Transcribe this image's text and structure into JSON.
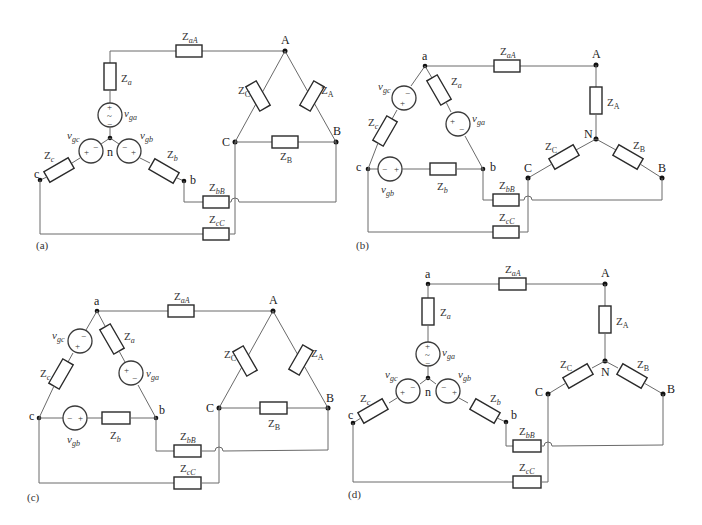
{
  "figure": {
    "panels": [
      {
        "id": "a",
        "caption": "(a)",
        "source_topology": "wye",
        "load_topology": "delta",
        "nodes": {
          "source_a": "a",
          "source_b": "b",
          "source_c": "c",
          "source_neutral": "n",
          "load_A": "A",
          "load_B": "B",
          "load_C": "C"
        },
        "labels": {
          "Z_line_a": "Z",
          "Z_line_a_sub": "aA",
          "Z_line_b": "Z",
          "Z_line_b_sub": "bB",
          "Z_line_c": "Z",
          "Z_line_c_sub": "cC",
          "Z_src_a": "Z",
          "Z_src_a_sub": "a",
          "Z_src_b": "Z",
          "Z_src_b_sub": "b",
          "Z_src_c": "Z",
          "Z_src_c_sub": "c",
          "v_a": "v",
          "v_a_sub": "ga",
          "v_b": "v",
          "v_b_sub": "gb",
          "v_c": "v",
          "v_c_sub": "gc",
          "Z_load_A": "Z",
          "Z_load_A_sub": "A",
          "Z_load_B": "Z",
          "Z_load_B_sub": "B",
          "Z_load_C": "Z",
          "Z_load_C_sub": "C"
        }
      },
      {
        "id": "b",
        "caption": "(b)",
        "source_topology": "delta",
        "load_topology": "wye",
        "nodes": {
          "source_a": "a",
          "source_b": "b",
          "source_c": "c",
          "load_A": "A",
          "load_B": "B",
          "load_C": "C",
          "load_neutral": "N"
        },
        "labels": {
          "Z_line_a": "Z",
          "Z_line_a_sub": "aA",
          "Z_line_b": "Z",
          "Z_line_b_sub": "bB",
          "Z_line_c": "Z",
          "Z_line_c_sub": "cC",
          "Z_src_a": "Z",
          "Z_src_a_sub": "a",
          "Z_src_b": "Z",
          "Z_src_b_sub": "b",
          "Z_src_c": "Z",
          "Z_src_c_sub": "c",
          "v_a": "v",
          "v_a_sub": "ga",
          "v_b": "v",
          "v_b_sub": "gb",
          "v_c": "v",
          "v_c_sub": "gc",
          "Z_load_A": "Z",
          "Z_load_A_sub": "A",
          "Z_load_B": "Z",
          "Z_load_B_sub": "B",
          "Z_load_C": "Z",
          "Z_load_C_sub": "C"
        }
      },
      {
        "id": "c",
        "caption": "(c)",
        "source_topology": "delta",
        "load_topology": "delta",
        "nodes": {
          "source_a": "a",
          "source_b": "b",
          "source_c": "c",
          "load_A": "A",
          "load_B": "B",
          "load_C": "C"
        },
        "labels": {
          "Z_line_a": "Z",
          "Z_line_a_sub": "aA",
          "Z_line_b": "Z",
          "Z_line_b_sub": "bB",
          "Z_line_c": "Z",
          "Z_line_c_sub": "cC",
          "Z_src_a": "Z",
          "Z_src_a_sub": "a",
          "Z_src_b": "Z",
          "Z_src_b_sub": "b",
          "Z_src_c": "Z",
          "Z_src_c_sub": "c",
          "v_a": "v",
          "v_a_sub": "ga",
          "v_b": "v",
          "v_b_sub": "gb",
          "v_c": "v",
          "v_c_sub": "gc",
          "Z_load_A": "Z",
          "Z_load_A_sub": "A",
          "Z_load_B": "Z",
          "Z_load_B_sub": "B",
          "Z_load_C": "Z",
          "Z_load_C_sub": "C"
        }
      },
      {
        "id": "d",
        "caption": "(d)",
        "source_topology": "wye",
        "load_topology": "wye",
        "nodes": {
          "source_a": "a",
          "source_b": "b",
          "source_c": "c",
          "source_neutral": "n",
          "load_A": "A",
          "load_B": "B",
          "load_C": "C",
          "load_neutral": "N"
        },
        "labels": {
          "Z_line_a": "Z",
          "Z_line_a_sub": "aA",
          "Z_line_b": "Z",
          "Z_line_b_sub": "bB",
          "Z_line_c": "Z",
          "Z_line_c_sub": "cC",
          "Z_src_a": "Z",
          "Z_src_a_sub": "a",
          "Z_src_b": "Z",
          "Z_src_b_sub": "b",
          "Z_src_c": "Z",
          "Z_src_c_sub": "c",
          "v_a": "v",
          "v_a_sub": "ga",
          "v_b": "v",
          "v_b_sub": "gb",
          "v_c": "v",
          "v_c_sub": "gc",
          "Z_load_A": "Z",
          "Z_load_A_sub": "A",
          "Z_load_B": "Z",
          "Z_load_B_sub": "B",
          "Z_load_C": "Z",
          "Z_load_C_sub": "C"
        }
      }
    ],
    "source_symbols": {
      "plus": "+",
      "minus": "−",
      "tilde": "~"
    },
    "colors": {
      "wire": "#6a6a6a",
      "component": "#2a2a2a",
      "node": "#111111",
      "text": "#333333"
    }
  }
}
